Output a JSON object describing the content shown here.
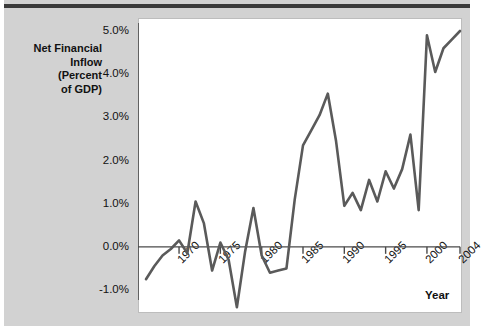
{
  "figure": {
    "background_color": "#d2d2d2",
    "plot_background_color": "#ffffff",
    "line_color": "#5a5a5a",
    "axis_color": "#4a4a4a"
  },
  "axis_titles": {
    "y_line1": "Net Financial",
    "y_line2": "Inflow",
    "y_line3": "(Percent",
    "y_line4": "of GDP)",
    "x": "Year"
  },
  "chart_data": {
    "type": "line",
    "title": "",
    "subtitle": "",
    "xlabel": "Year",
    "ylabel": "Net Financial Inflow (Percent of GDP)",
    "grid": false,
    "legend": "none",
    "xlim": [
      1966,
      2004
    ],
    "ylim": [
      -1.5,
      5.2
    ],
    "y_ticks": [
      -1.0,
      0.0,
      1.0,
      2.0,
      3.0,
      4.0,
      5.0
    ],
    "y_tick_labels": [
      "-1.0%",
      "0.0%",
      "1.0%",
      "2.0%",
      "3.0%",
      "4.0%",
      "5.0%"
    ],
    "x_ticks": [
      1970,
      1975,
      1980,
      1985,
      1990,
      1995,
      2000,
      2004
    ],
    "x_tick_labels": [
      "1970",
      "1975",
      "1980",
      "1985",
      "1990",
      "1995",
      "2000",
      "2004"
    ],
    "zero_line": 0.0,
    "series": [
      {
        "name": "Net Financial Inflow (Percent of GDP)",
        "x": [
          1966,
          1967,
          1968,
          1969,
          1970,
          1971,
          1972,
          1973,
          1974,
          1975,
          1976,
          1977,
          1978,
          1979,
          1980,
          1981,
          1982,
          1983,
          1984,
          1985,
          1986,
          1987,
          1988,
          1989,
          1990,
          1991,
          1992,
          1993,
          1994,
          1995,
          1996,
          1997,
          1998,
          1999,
          2000,
          2001,
          2002,
          2003,
          2004
        ],
        "values": [
          -0.75,
          -0.45,
          -0.2,
          -0.05,
          0.15,
          -0.15,
          1.05,
          0.55,
          -0.55,
          0.1,
          -0.3,
          -1.4,
          -0.1,
          0.9,
          -0.2,
          -0.6,
          -0.55,
          -0.5,
          1.1,
          2.35,
          2.7,
          3.05,
          3.55,
          2.45,
          0.95,
          1.25,
          0.85,
          1.55,
          1.05,
          1.75,
          1.35,
          1.8,
          2.6,
          0.85,
          4.9,
          4.05,
          4.6,
          4.8,
          5.0
        ]
      }
    ]
  }
}
